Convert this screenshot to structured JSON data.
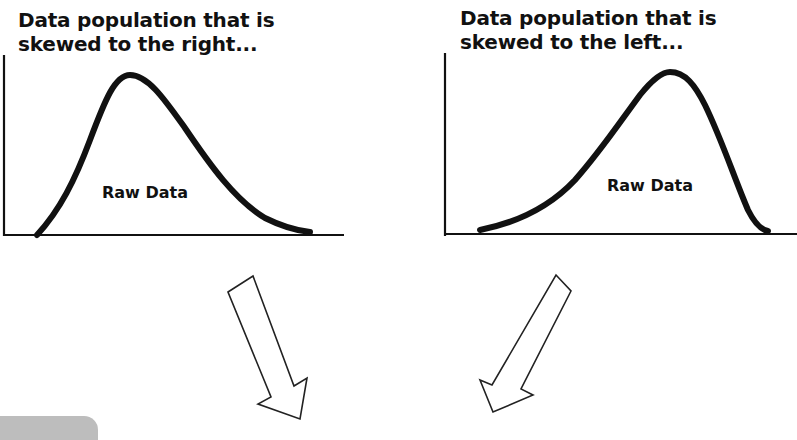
{
  "panels": [
    {
      "id": "left",
      "title_lines": [
        "Data population that is",
        "skewed to the right..."
      ],
      "curve_label": "Raw Data",
      "skew": "right"
    },
    {
      "id": "right",
      "title_lines": [
        "Data population that is",
        "skewed to the left..."
      ],
      "curve_label": "Raw Data",
      "skew": "left"
    }
  ],
  "arrows": [
    {
      "name": "arrow-down-right",
      "direction": "down-right"
    },
    {
      "name": "arrow-down-left",
      "direction": "down-left"
    }
  ],
  "colors": {
    "ink": "#111111",
    "background": "#ffffff",
    "tab_gray": "#bdbdbd"
  }
}
